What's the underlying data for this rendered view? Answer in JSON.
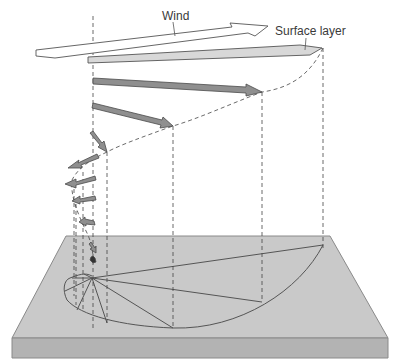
{
  "diagram": {
    "labels": {
      "wind": "Wind",
      "surface_layer": "Surface layer"
    },
    "colors": {
      "block_top": "#c8c8c8",
      "block_front": "#b4b4b4",
      "block_edge": "#8a8a8a",
      "arrow_fill": "#8c8c8c",
      "arrow_light": "#d6d6d6",
      "line": "#555555"
    },
    "arrows_count": 11
  }
}
